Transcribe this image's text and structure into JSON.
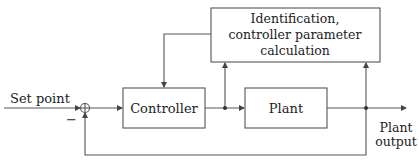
{
  "diagram": {
    "type": "block-diagram",
    "blocks": {
      "controller": "Controller",
      "plant": "Plant",
      "identification": [
        "Identification,",
        "controller parameter",
        "calculation"
      ]
    },
    "labels": {
      "input": "Set point",
      "output_line1": "Plant",
      "output_line2": "output",
      "minus_sign": "−"
    },
    "colors": {
      "line": "#444444",
      "text": "#222222",
      "background": "#ffffff"
    }
  }
}
